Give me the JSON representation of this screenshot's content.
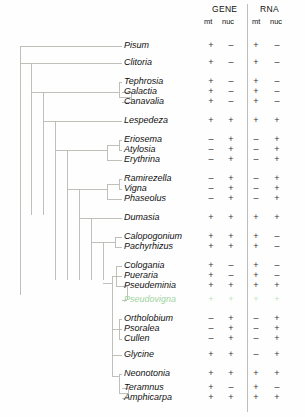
{
  "header": {
    "groups": [
      {
        "label": "GENE",
        "sub": [
          "mt",
          "nuc"
        ]
      },
      {
        "label": "RNA",
        "sub": [
          "mt",
          "nuc"
        ]
      }
    ]
  },
  "colors": {
    "branch": "#b9b9b3",
    "text": "#111111",
    "faint_taxon": "#9fd4a0",
    "divider": "#bdbdbd"
  },
  "chart_data": {
    "type": "table",
    "title": "",
    "xlabel": "",
    "ylabel": "",
    "columns": [
      "GENE mt",
      "GENE nuc",
      "RNA mt",
      "RNA nuc"
    ],
    "categories": [
      "Pisum",
      "Clitoria",
      "Tephrosia",
      "Galactia",
      "Canavalia",
      "Lespedeza",
      "Eriosema",
      "Atylosia",
      "Erythrina",
      "Ramirezella",
      "Vigna",
      "Phaseolus",
      "Dumasia",
      "Calopogonium",
      "Pachyrhizus",
      "Cologania",
      "Pueraria",
      "Pseudeminia",
      "Pseudovigna",
      "Ortholobium",
      "Psoralea",
      "Cullen",
      "Glycine",
      "Neonotonia",
      "Teramnus",
      "Amphicarpa"
    ],
    "rows": [
      {
        "taxon": "Pisum",
        "y": 46,
        "values": [
          "+",
          "–",
          "+",
          "–"
        ],
        "faint": false
      },
      {
        "taxon": "Clitoria",
        "y": 63,
        "values": [
          "+",
          "–",
          "+",
          "–"
        ],
        "faint": false
      },
      {
        "taxon": "Tephrosia",
        "y": 82,
        "values": [
          "+",
          "–",
          "+",
          "–"
        ],
        "faint": false
      },
      {
        "taxon": "Galactia",
        "y": 92,
        "values": [
          "+",
          "–",
          "+",
          "–"
        ],
        "faint": false
      },
      {
        "taxon": "Canavalia",
        "y": 102,
        "values": [
          "+",
          "–",
          "+",
          "–"
        ],
        "faint": false
      },
      {
        "taxon": "Lespedeza",
        "y": 121,
        "values": [
          "+",
          "+",
          "+",
          "+"
        ],
        "faint": false
      },
      {
        "taxon": "Eriosema",
        "y": 140,
        "values": [
          "–",
          "+",
          "–",
          "+"
        ],
        "faint": false
      },
      {
        "taxon": "Atylosia",
        "y": 150,
        "values": [
          "–",
          "+",
          "–",
          "+"
        ],
        "faint": false
      },
      {
        "taxon": "Erythrina",
        "y": 160,
        "values": [
          "–",
          "+",
          "–",
          "+"
        ],
        "faint": false
      },
      {
        "taxon": "Ramirezella",
        "y": 179,
        "values": [
          "–",
          "+",
          "–",
          "+"
        ],
        "faint": false
      },
      {
        "taxon": "Vigna",
        "y": 189,
        "values": [
          "–",
          "+",
          "–",
          "+"
        ],
        "faint": false
      },
      {
        "taxon": "Phaseolus",
        "y": 199,
        "values": [
          "–",
          "+",
          "–",
          "+"
        ],
        "faint": false
      },
      {
        "taxon": "Dumasia",
        "y": 218,
        "values": [
          "+",
          "+",
          "+",
          "+"
        ],
        "faint": false
      },
      {
        "taxon": "Calopogonium",
        "y": 237,
        "values": [
          "+",
          "+",
          "+",
          "–"
        ],
        "faint": false
      },
      {
        "taxon": "Pachyrhizus",
        "y": 247,
        "values": [
          "+",
          "+",
          "+",
          "–"
        ],
        "faint": false
      },
      {
        "taxon": "Cologania",
        "y": 266,
        "values": [
          "+",
          "–",
          "+",
          "–"
        ],
        "faint": false
      },
      {
        "taxon": "Pueraria",
        "y": 276,
        "values": [
          "+",
          "–",
          "+",
          "–"
        ],
        "faint": false
      },
      {
        "taxon": "Pseudeminia",
        "y": 286,
        "values": [
          "+",
          "+",
          "+",
          "+"
        ],
        "faint": false
      },
      {
        "taxon": "Pseudovigna",
        "y": 300,
        "values": [
          "+",
          "+",
          "+",
          "+"
        ],
        "faint": true
      },
      {
        "taxon": "Ortholobium",
        "y": 319,
        "values": [
          "–",
          "+",
          "–",
          "+"
        ],
        "faint": false
      },
      {
        "taxon": "Psoralea",
        "y": 329,
        "values": [
          "–",
          "+",
          "–",
          "+"
        ],
        "faint": false
      },
      {
        "taxon": "Cullen",
        "y": 339,
        "values": [
          "–",
          "+",
          "–",
          "+"
        ],
        "faint": false
      },
      {
        "taxon": "Glycine",
        "y": 355,
        "values": [
          "+",
          "+",
          "–",
          "+"
        ],
        "faint": false
      },
      {
        "taxon": "Neonotonia",
        "y": 374,
        "values": [
          "+",
          "+",
          "+",
          "+"
        ],
        "faint": false
      },
      {
        "taxon": "Teramnus",
        "y": 388,
        "values": [
          "+",
          "–",
          "+",
          "–"
        ],
        "faint": false
      },
      {
        "taxon": "Amphicarpa",
        "y": 398,
        "values": [
          "+",
          "+",
          "+",
          "+"
        ],
        "faint": false
      }
    ],
    "column_x": [
      211,
      231,
      256,
      277
    ]
  }
}
